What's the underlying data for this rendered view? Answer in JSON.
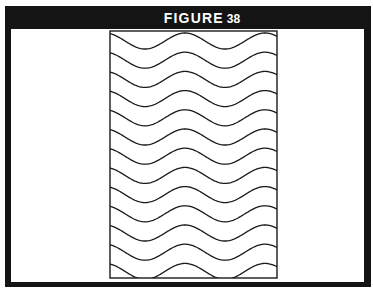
{
  "figure": {
    "title_word": "FIGURE",
    "title_number": "38",
    "colors": {
      "frame": "#141414",
      "background": "#ffffff",
      "lines": "#1a1a1a"
    },
    "pattern": {
      "description": "Rectangle filled with parallel horizontal wavy lines",
      "wave_count": 13,
      "rect": {
        "x": 110,
        "y": 31,
        "width": 167,
        "height": 247
      },
      "first_crest_y": 33,
      "spacing": 19.2,
      "amplitude": 8,
      "period": 80
    }
  }
}
